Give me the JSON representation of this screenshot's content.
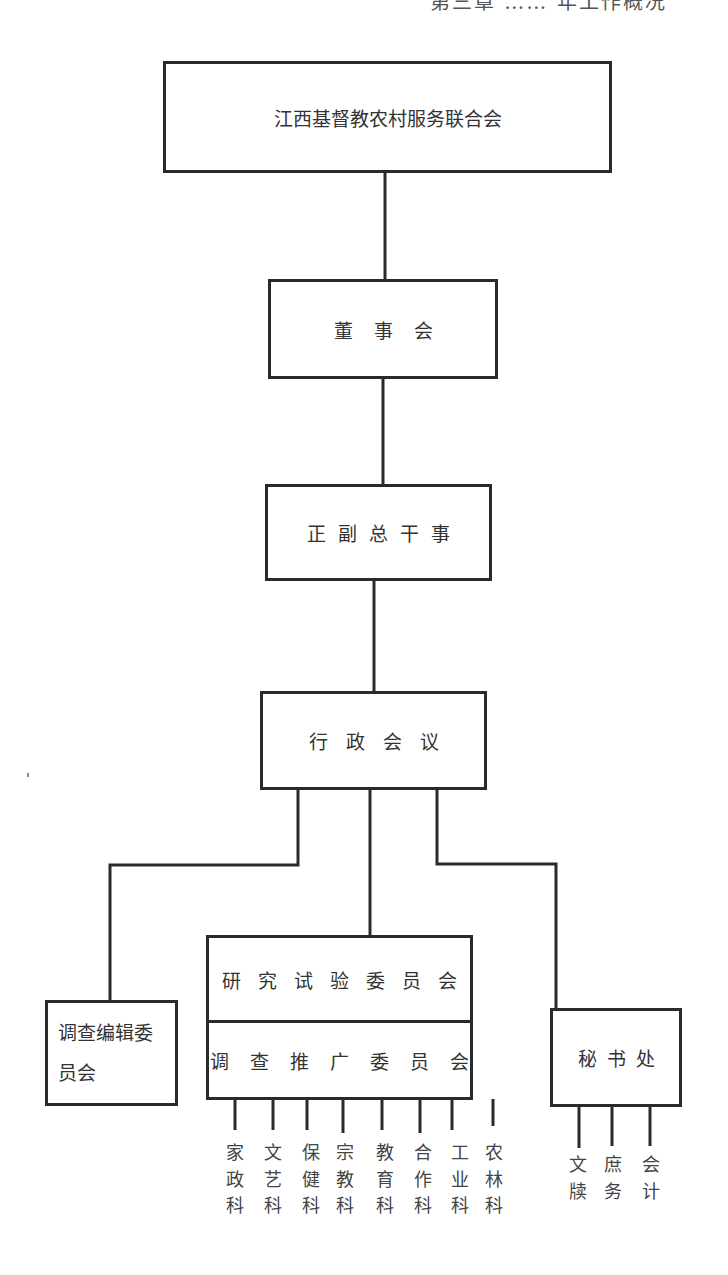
{
  "page_header": "第三章 …… 年工作概况",
  "org_chart": {
    "root": "江西基督教农村服务联合会",
    "board": "董事会",
    "directors": "正副总干事",
    "executive_meeting": "行政会议",
    "survey_editorial_committee": "调查编辑委员会",
    "research_committee": "研究试验委员会",
    "extension_committee": "调查推广委员会",
    "secretariat": "秘书处",
    "extension_sections": [
      {
        "label": "家政科"
      },
      {
        "label": "文艺科"
      },
      {
        "label": "保健科"
      },
      {
        "label": "宗教科"
      },
      {
        "label": "教育科"
      },
      {
        "label": "合作科"
      },
      {
        "label": "工业科"
      },
      {
        "label": "农林科"
      }
    ],
    "secretariat_sections": [
      {
        "label": "文牍"
      },
      {
        "label": "庶务"
      },
      {
        "label": "会计"
      }
    ]
  },
  "colors": {
    "line": "#2a2a2a",
    "text": "#333333",
    "background": "#ffffff"
  }
}
